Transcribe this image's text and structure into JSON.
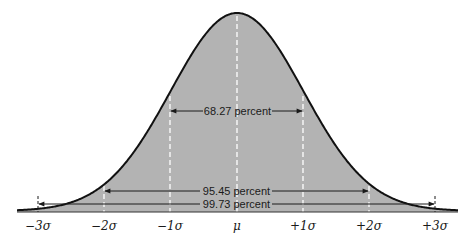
{
  "diagram": {
    "colors": {
      "fill": "#b3b3b3",
      "curve": "#111111",
      "guide_lines": "#ffffff",
      "text": "#1a1a1a",
      "background": "#ffffff"
    },
    "axis_labels": [
      {
        "key": "m3",
        "text": "−3σ"
      },
      {
        "key": "m2",
        "text": "−2σ"
      },
      {
        "key": "m1",
        "text": "−1σ"
      },
      {
        "key": "mu",
        "text": "μ"
      },
      {
        "key": "p1",
        "text": "+1σ"
      },
      {
        "key": "p2",
        "text": "+2σ"
      },
      {
        "key": "p3",
        "text": "+3σ"
      }
    ],
    "intervals": [
      {
        "range": "±1σ",
        "label": "68.27 percent"
      },
      {
        "range": "±2σ",
        "label": "95.45 percent"
      },
      {
        "range": "±3σ",
        "label": "99.73 percent"
      }
    ]
  }
}
